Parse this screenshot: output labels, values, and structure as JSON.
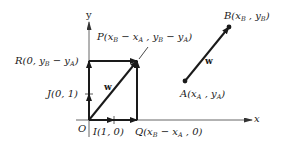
{
  "diagram": {
    "axes": {
      "x_label": "x",
      "y_label": "y",
      "origin_label": "O"
    },
    "points": {
      "O": {
        "label": "O",
        "coords": ""
      },
      "I": {
        "label": "I(1, 0)"
      },
      "J": {
        "label": "J(0, 1)"
      },
      "Q": {
        "label": "Q(x_B − x_A , 0)"
      },
      "R": {
        "label": "R(0, y_B − y_A)"
      },
      "P": {
        "label": "P(x_B − x_A , y_B − y_A)"
      },
      "A": {
        "label": "A(x_A , y_A)"
      },
      "B": {
        "label": "B(x_B , y_B)"
      }
    },
    "vectors": [
      {
        "name": "w",
        "from": "O",
        "to": "P",
        "label": "w"
      },
      {
        "name": "w",
        "from": "A",
        "to": "B",
        "label": "w"
      }
    ],
    "label_text": {
      "O": "O",
      "I": "I(1, 0)",
      "J": "J(0, 1)",
      "x": "x",
      "y": "y",
      "w1": "w",
      "w2": "w"
    },
    "colors": {
      "stroke": "#1a1a1a",
      "axis": "#555555"
    }
  }
}
